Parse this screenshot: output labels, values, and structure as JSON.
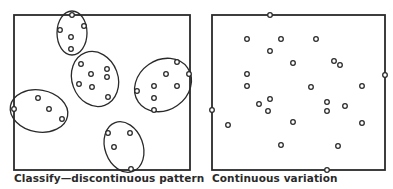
{
  "panels": [
    {
      "id": "left",
      "caption": "Classify—discontinuous pattern",
      "box": {
        "x": 14,
        "y": 15,
        "w": 176,
        "h": 155
      },
      "clusters": [
        {
          "ellipse": {
            "cx": 72,
            "cy": 33,
            "rx": 15,
            "ry": 22,
            "rot": 0
          },
          "points": [
            [
              72,
              15
            ],
            [
              84,
              26
            ],
            [
              60,
              30
            ],
            [
              71,
              37
            ],
            [
              71,
              49
            ]
          ]
        },
        {
          "ellipse": {
            "cx": 95,
            "cy": 79,
            "rx": 23,
            "ry": 28,
            "rot": -20
          },
          "points": [
            [
              81,
              64
            ],
            [
              91,
              74
            ],
            [
              107,
              69
            ],
            [
              107,
              77
            ],
            [
              79,
              84
            ],
            [
              92,
              87
            ],
            [
              108,
              97
            ]
          ]
        },
        {
          "ellipse": {
            "cx": 163,
            "cy": 85,
            "rx": 30,
            "ry": 25,
            "rot": -35
          },
          "points": [
            [
              177,
              62
            ],
            [
              189,
              74
            ],
            [
              166,
              74
            ],
            [
              154,
              86
            ],
            [
              177,
              86
            ],
            [
              137,
              91
            ],
            [
              154,
              98
            ],
            [
              154,
              110
            ]
          ]
        },
        {
          "ellipse": {
            "cx": 39,
            "cy": 111,
            "rx": 29,
            "ry": 21,
            "rot": 10
          },
          "points": [
            [
              14,
              109
            ],
            [
              38,
              98
            ],
            [
              49,
              109
            ],
            [
              62,
              119
            ]
          ]
        },
        {
          "ellipse": {
            "cx": 124,
            "cy": 147,
            "rx": 19,
            "ry": 26,
            "rot": -20
          },
          "points": [
            [
              108,
              133
            ],
            [
              130,
              133
            ],
            [
              114,
              147
            ],
            [
              131,
              169
            ]
          ]
        }
      ]
    },
    {
      "id": "right",
      "caption": "Continuous variation",
      "box": {
        "x": 212,
        "y": 15,
        "w": 173,
        "h": 155
      },
      "points": [
        [
          270,
          15
        ],
        [
          247,
          39
        ],
        [
          281,
          39
        ],
        [
          316,
          39
        ],
        [
          270,
          51
        ],
        [
          293,
          63
        ],
        [
          334,
          61
        ],
        [
          340,
          65
        ],
        [
          247,
          74
        ],
        [
          247,
          86
        ],
        [
          311,
          87
        ],
        [
          362,
          86
        ],
        [
          385,
          75
        ],
        [
          270,
          99
        ],
        [
          259,
          104
        ],
        [
          327,
          102
        ],
        [
          212,
          110
        ],
        [
          268,
          111
        ],
        [
          327,
          111
        ],
        [
          345,
          106
        ],
        [
          228,
          125
        ],
        [
          293,
          122
        ],
        [
          362,
          123
        ],
        [
          281,
          145
        ],
        [
          338,
          146
        ],
        [
          327,
          170
        ]
      ]
    }
  ],
  "colors": {
    "stroke": "#2a2a2a",
    "background": "#ffffff"
  }
}
